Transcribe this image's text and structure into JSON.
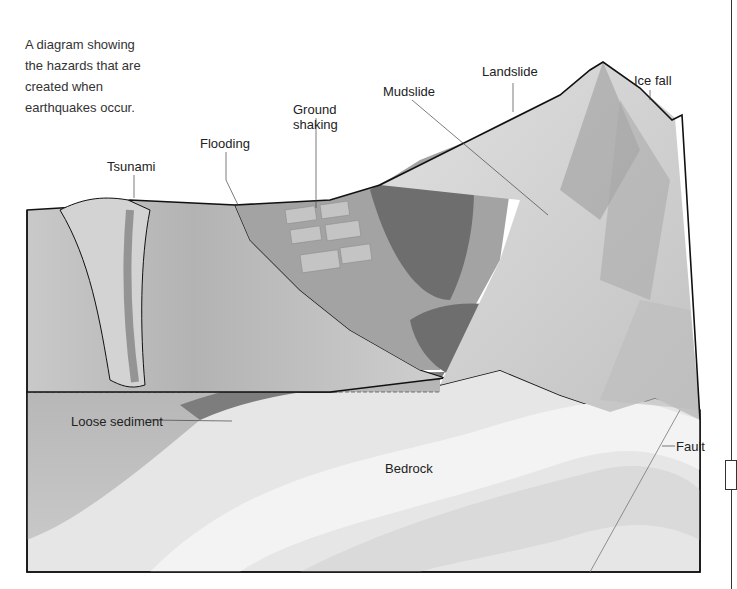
{
  "intro": {
    "lines": [
      "A diagram showing",
      "the hazards that are",
      "created when",
      "earthquakes occur."
    ]
  },
  "labels": {
    "tsunami": "Tsunami",
    "flooding": "Flooding",
    "ground_shaking_1": "Ground",
    "ground_shaking_2": "shaking",
    "mudslide": "Mudslide",
    "landslide": "Landslide",
    "ice_fall": "Ice fall",
    "loose_sediment": "Loose sediment",
    "bedrock": "Bedrock",
    "fault": "Fault"
  },
  "colors": {
    "sea": "#b8b8b8",
    "land": "#9a9a9a",
    "forest": "#6e6e6e",
    "mountain": "#d4d4d4",
    "bedrock": "#e6e6e6",
    "sediment": "#a9a9a9",
    "outline": "#111111"
  }
}
